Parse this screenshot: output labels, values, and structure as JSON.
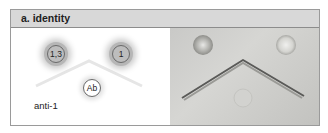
{
  "panel": {
    "title": "a. identity"
  },
  "diagram": {
    "wells": [
      {
        "id": "well-1-3",
        "label": "1,3"
      },
      {
        "id": "well-1",
        "label": "1"
      },
      {
        "id": "well-ab",
        "label": "Ab"
      }
    ],
    "antibody_label": "anti-1"
  },
  "photo": {
    "description": "Immunodiffusion plate photograph showing chevron precipitin line (line of identity)"
  },
  "colors": {
    "header_bg": "#d8d8d8",
    "border": "#9a9a9a",
    "halo": "#b6b6b6",
    "photo_bg": "#cdcdca"
  }
}
